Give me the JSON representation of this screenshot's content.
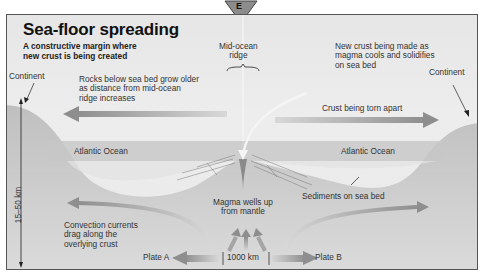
{
  "badge": {
    "letter": "E"
  },
  "header": {
    "title": "Sea-floor spreading",
    "subtitle": "A constructive margin where\nnew crust is being created"
  },
  "labels": {
    "mid_ocean_ridge": "Mid-ocean\nridge",
    "new_crust": "New crust being made as\nmagma cools and solidifies\non sea bed",
    "continent_left": "Continent",
    "continent_right": "Continent",
    "rocks_older": "Rocks below sea bed grow older\nas distance from mid-ocean\nridge increases",
    "crust_torn": "Crust being torn apart",
    "ocean_left": "Atlantic Ocean",
    "ocean_right": "Atlantic Ocean",
    "depth_scale": "15–50 km",
    "sediments": "Sediments on sea bed",
    "magma_wells": "Magma wells up\nfrom mantle",
    "convection": "Convection currents\ndrag along the\noverlying crust",
    "plate_a": "Plate A",
    "plate_b": "Plate B",
    "distance_scale": "1000 km"
  },
  "colors": {
    "background": "#e9e9e9",
    "border": "#555555",
    "ocean": "#c9c9c9",
    "crust": "#b5b5b5",
    "arrow": "#9a9a9a",
    "text": "#333333"
  }
}
